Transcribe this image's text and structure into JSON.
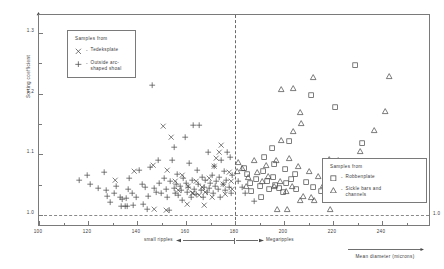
{
  "chart_data": {
    "type": "scatter",
    "title": "",
    "xlabel": "Mean diameter (microns)",
    "ylabel": "Sorting coefficient",
    "xlim": [
      100,
      260
    ],
    "ylim": [
      0.98,
      1.33
    ],
    "xticks": [
      100,
      120,
      140,
      160,
      180,
      200,
      220,
      240
    ],
    "xticklabels": [
      "100",
      "120",
      "140",
      "160",
      "180",
      "200",
      "220",
      "240"
    ],
    "xminorticks": [
      110,
      130,
      150,
      170,
      190,
      210,
      230,
      250
    ],
    "yticks": [
      1.0,
      1.1,
      1.2,
      1.3
    ],
    "yticklabels": [
      "1.0",
      "1.1",
      "1.2",
      "1.3"
    ],
    "yminorticks": [
      1.05,
      1.15,
      1.25
    ],
    "grid": false,
    "legend_position": "upper-left and lower-right",
    "annotations": {
      "divider_x": 180,
      "divider_style": "dashed vertical line",
      "baseline_y": 1.0,
      "baseline_style": "dashed horizontal line",
      "baseline_label": "1.0",
      "left_regime": "small ripples",
      "right_regime": "Megaripples"
    },
    "legends": [
      {
        "id": "legend-left",
        "title": "Samples from",
        "entries": [
          {
            "marker": "cross-x",
            "dash": "-",
            "label": "Tedeksplate"
          },
          {
            "marker": "plus",
            "dash": "-",
            "label": "Outside arc-\nshaped shoal"
          }
        ]
      },
      {
        "id": "legend-right",
        "title": "Samples from",
        "entries": [
          {
            "marker": "square",
            "dash": "-",
            "label": "Robbenplate"
          },
          {
            "marker": "triangle",
            "dash": "-",
            "label": "Sickle bars and\nchannels"
          }
        ]
      }
    ],
    "series": [
      {
        "name": "Outside arc-shaped shoal",
        "marker": "plus",
        "points": [
          [
            116.5,
            1.058
          ],
          [
            119.5,
            1.066
          ],
          [
            121.0,
            1.05
          ],
          [
            124.0,
            1.044
          ],
          [
            126.5,
            1.071
          ],
          [
            127.5,
            1.04
          ],
          [
            128.0,
            1.031
          ],
          [
            130.5,
            1.035
          ],
          [
            131.5,
            1.048
          ],
          [
            133.0,
            1.029
          ],
          [
            134.0,
            1.026
          ],
          [
            135.5,
            1.027
          ],
          [
            136.5,
            1.043
          ],
          [
            137.0,
            1.061
          ],
          [
            138.0,
            1.036
          ],
          [
            139.5,
            1.03
          ],
          [
            141.0,
            1.074
          ],
          [
            142.0,
            1.05
          ],
          [
            143.5,
            1.046
          ],
          [
            144.5,
            1.031
          ],
          [
            145.5,
            1.078
          ],
          [
            146.0,
            1.214
          ],
          [
            147.0,
            1.044
          ],
          [
            148.0,
            1.038
          ],
          [
            149.0,
            1.052
          ],
          [
            150.0,
            1.036
          ],
          [
            151.0,
            1.06
          ],
          [
            152.0,
            1.042
          ],
          [
            152.5,
            1.029
          ],
          [
            153.5,
            1.056
          ],
          [
            154.5,
            1.09
          ],
          [
            155.0,
            1.044
          ],
          [
            155.5,
            1.036
          ],
          [
            156.0,
            1.05
          ],
          [
            156.5,
            1.068
          ],
          [
            157.0,
            1.033
          ],
          [
            157.5,
            1.048
          ],
          [
            158.0,
            1.041
          ],
          [
            158.5,
            1.025
          ],
          [
            159.0,
            1.06
          ],
          [
            159.5,
            1.128
          ],
          [
            160.0,
            1.053
          ],
          [
            160.5,
            1.038
          ],
          [
            161.0,
            1.045
          ],
          [
            161.5,
            1.086
          ],
          [
            162.0,
            1.029
          ],
          [
            162.5,
            1.057
          ],
          [
            163.0,
            1.148
          ],
          [
            163.5,
            1.042
          ],
          [
            164.0,
            1.034
          ],
          [
            164.5,
            1.074
          ],
          [
            165.0,
            1.05
          ],
          [
            165.5,
            1.148
          ],
          [
            166.0,
            1.04
          ],
          [
            166.5,
            1.063
          ],
          [
            167.0,
            1.03
          ],
          [
            167.5,
            1.046
          ],
          [
            168.0,
            1.057
          ],
          [
            168.5,
            1.038
          ],
          [
            169.0,
            1.103
          ],
          [
            169.5,
            1.044
          ],
          [
            170.0,
            1.052
          ],
          [
            170.5,
            1.066
          ],
          [
            171.0,
            1.035
          ],
          [
            171.5,
            1.08
          ],
          [
            172.0,
            1.048
          ],
          [
            172.5,
            1.055
          ],
          [
            173.0,
            1.042
          ],
          [
            173.5,
            1.062
          ],
          [
            174.0,
            1.03
          ],
          [
            174.5,
            1.09
          ],
          [
            175.0,
            1.05
          ],
          [
            175.5,
            1.072
          ],
          [
            176.0,
            1.04
          ],
          [
            176.5,
            1.058
          ],
          [
            177.0,
            1.104
          ],
          [
            177.5,
            1.046
          ],
          [
            178.0,
            1.095
          ],
          [
            178.5,
            1.036
          ],
          [
            179.0,
            1.066
          ],
          [
            155.0,
            1.112
          ],
          [
            148.5,
            1.09
          ],
          [
            142.5,
            1.018
          ],
          [
            138.5,
            1.016
          ],
          [
            133.5,
            1.014
          ],
          [
            135.0,
            1.014
          ],
          [
            136.0,
            1.014
          ],
          [
            129.0,
            1.021
          ],
          [
            144.0,
            1.01
          ],
          [
            153.0,
            1.007
          ],
          [
            181.5,
            1.056
          ],
          [
            183.0,
            1.046
          ],
          [
            184.0,
            1.035
          ],
          [
            188.0,
            1.022
          ]
        ]
      },
      {
        "name": "Tedeksplate",
        "marker": "cross-x",
        "points": [
          [
            131.0,
            1.058
          ],
          [
            139.0,
            1.072
          ],
          [
            146.5,
            1.082
          ],
          [
            150.5,
            1.146
          ],
          [
            152.5,
            1.073
          ],
          [
            155.5,
            1.055
          ],
          [
            157.0,
            1.04
          ],
          [
            158.5,
            1.065
          ],
          [
            161.0,
            1.048
          ],
          [
            162.5,
            1.036
          ],
          [
            164.0,
            1.055
          ],
          [
            165.5,
            1.032
          ],
          [
            166.5,
            1.045
          ],
          [
            168.0,
            1.038
          ],
          [
            169.5,
            1.06
          ],
          [
            170.5,
            1.029
          ],
          [
            171.5,
            1.08
          ],
          [
            172.5,
            1.094
          ],
          [
            173.5,
            1.104
          ],
          [
            174.5,
            1.115
          ],
          [
            175.0,
            1.05
          ],
          [
            176.0,
            1.034
          ],
          [
            177.5,
            1.07
          ],
          [
            178.5,
            1.055
          ],
          [
            152.0,
            1.007
          ],
          [
            147.0,
            1.01
          ],
          [
            160.5,
            1.018
          ],
          [
            167.5,
            1.016
          ],
          [
            154.0,
            1.128
          ],
          [
            163.0,
            1.036
          ],
          [
            179.0,
            1.043
          ]
        ]
      },
      {
        "name": "Robbenplate",
        "marker": "square",
        "points": [
          [
            185.0,
            1.068
          ],
          [
            186.0,
            1.053
          ],
          [
            188.5,
            1.06
          ],
          [
            190.0,
            1.048
          ],
          [
            191.5,
            1.072
          ],
          [
            193.0,
            1.056
          ],
          [
            194.0,
            1.042
          ],
          [
            195.5,
            1.062
          ],
          [
            196.5,
            1.05
          ],
          [
            198.0,
            1.044
          ],
          [
            199.5,
            1.038
          ],
          [
            201.0,
            1.052
          ],
          [
            203.0,
            1.06
          ],
          [
            205.0,
            1.043
          ],
          [
            192.0,
            1.095
          ],
          [
            196.0,
            1.084
          ],
          [
            200.5,
            1.076
          ],
          [
            204.5,
            1.068
          ],
          [
            209.0,
            1.055
          ],
          [
            212.0,
            1.046
          ],
          [
            195.0,
            1.11
          ],
          [
            202.0,
            1.122
          ],
          [
            211.0,
            1.198
          ],
          [
            221.0,
            1.178
          ],
          [
            229.0,
            1.248
          ],
          [
            232.0,
            1.118
          ],
          [
            183.5,
            1.078
          ],
          [
            186.5,
            1.04
          ],
          [
            215.0,
            1.04
          ],
          [
            190.5,
            1.03
          ]
        ]
      },
      {
        "name": "Sickle bars and channels",
        "marker": "triangle",
        "points": [
          [
            183.0,
            1.078
          ],
          [
            185.5,
            1.062
          ],
          [
            189.0,
            1.07
          ],
          [
            191.0,
            1.056
          ],
          [
            193.5,
            1.064
          ],
          [
            196.0,
            1.048
          ],
          [
            198.5,
            1.056
          ],
          [
            201.0,
            1.04
          ],
          [
            203.5,
            1.048
          ],
          [
            188.0,
            1.09
          ],
          [
            193.0,
            1.082
          ],
          [
            197.0,
            1.09
          ],
          [
            202.0,
            1.094
          ],
          [
            206.0,
            1.08
          ],
          [
            210.5,
            1.072
          ],
          [
            214.0,
            1.064
          ],
          [
            199.0,
            1.124
          ],
          [
            204.0,
            1.138
          ],
          [
            207.0,
            1.152
          ],
          [
            206.5,
            1.17
          ],
          [
            212.0,
            1.228
          ],
          [
            199.0,
            1.208
          ],
          [
            204.0,
            1.21
          ],
          [
            218.5,
            1.092
          ],
          [
            222.0,
            1.09
          ],
          [
            226.0,
            1.066
          ],
          [
            231.0,
            1.105
          ],
          [
            237.0,
            1.14
          ],
          [
            241.5,
            1.172
          ],
          [
            243.0,
            1.23
          ],
          [
            235.5,
            1.086
          ],
          [
            208.0,
            1.032
          ],
          [
            211.0,
            1.03
          ],
          [
            206.5,
            1.024
          ],
          [
            212.5,
            1.024
          ],
          [
            216.0,
            1.05
          ],
          [
            197.5,
            1.01
          ],
          [
            201.5,
            1.01
          ],
          [
            219.0,
            1.01
          ],
          [
            181.5,
            1.088
          ],
          [
            181.0,
            1.072
          ],
          [
            184.5,
            1.048
          ]
        ]
      }
    ]
  }
}
